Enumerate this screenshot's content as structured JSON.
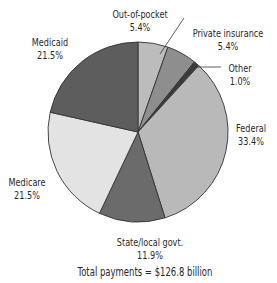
{
  "chart_data": {
    "type": "pie",
    "title": "",
    "caption": "Total payments = $126.8 billion",
    "start_angle_deg": 0,
    "direction": "clockwise",
    "slices": [
      {
        "label": "Out-of-pocket",
        "value": 5.4,
        "value_label": "5.4%",
        "color": "#bcbcbc"
      },
      {
        "label": "Private insurance",
        "value": 5.4,
        "value_label": "5.4%",
        "color": "#8e8e8e"
      },
      {
        "label": "Other",
        "value": 1.0,
        "value_label": "1.0%",
        "color": "#3c3c3c"
      },
      {
        "label": "Federal",
        "value": 33.4,
        "value_label": "33.4%",
        "color": "#b9b9b9"
      },
      {
        "label": "State/local govt.",
        "value": 11.9,
        "value_label": "11.9%",
        "color": "#6b6b6b"
      },
      {
        "label": "Medicare",
        "value": 21.5,
        "value_label": "21.5%",
        "color": "#e3e3e3"
      },
      {
        "label": "Medicaid",
        "value": 21.5,
        "value_label": "21.5%",
        "color": "#5d5d5d"
      }
    ],
    "legend": "none (direct labels)"
  },
  "labels": {
    "out_of_pocket": {
      "name": "Out-of-pocket",
      "pct": "5.4%"
    },
    "private_insurance": {
      "name": "Private insurance",
      "pct": "5.4%"
    },
    "other": {
      "name": "Other",
      "pct": "1.0%"
    },
    "federal": {
      "name": "Federal",
      "pct": "33.4%"
    },
    "state_local": {
      "name": "State/local govt.",
      "pct": "11.9%"
    },
    "medicare": {
      "name": "Medicare",
      "pct": "21.5%"
    },
    "medicaid": {
      "name": "Medicaid",
      "pct": "21.5%"
    }
  },
  "caption": "Total payments = $126.8 billion"
}
